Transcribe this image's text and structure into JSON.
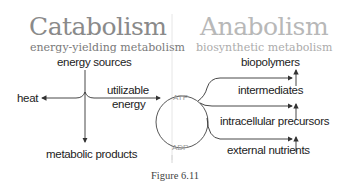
{
  "catabolism": {
    "title": "Catabolism",
    "subtitle": "energy-yielding metabolism",
    "energy_sources": "energy sources",
    "heat": "heat",
    "utilizable_energy_line1": "utilizable",
    "utilizable_energy_line2": "energy",
    "metabolic_products": "metabolic products"
  },
  "anabolism": {
    "title": "Anabolism",
    "subtitle": "biosynthetic metabolism",
    "biopolymers": "biopolymers",
    "intermediates": "intermediates",
    "intracellular_precursors": "intracellular precursors",
    "external_nutrients": "external nutrients"
  },
  "cycle": {
    "atp": "ATP",
    "adp": "ADP"
  },
  "caption": "Figure 6.11",
  "colors": {
    "catabolism_title": "#8a8a8a",
    "anabolism_title": "#b8b8b8",
    "line": "#333333",
    "divider": "#e0e0e0"
  }
}
